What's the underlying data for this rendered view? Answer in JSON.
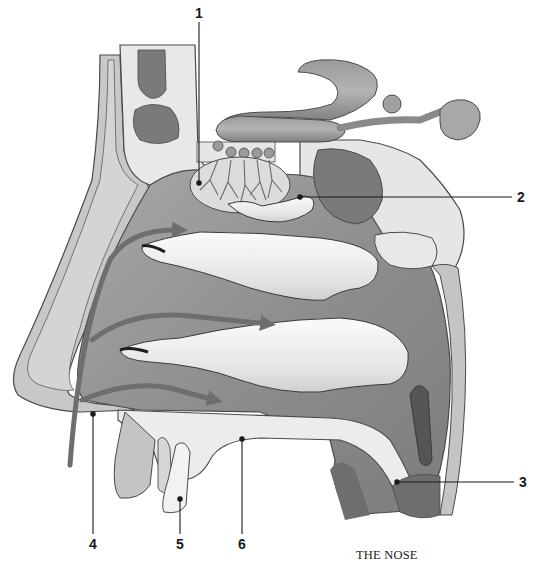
{
  "caption": "THE NOSE",
  "colors": {
    "bone_outline": "#4a4a4a",
    "cartilage_fill": "#c4c4c4",
    "light_fill": "#e6e6e6",
    "cavity_fill": "#9a9a9a",
    "sinus_fill": "#7a7a7a",
    "turbinate_fill": "#f2f2f2",
    "airflow_arrow": "#6e6e6e",
    "leader_line": "#1a1a1a"
  },
  "callouts": [
    {
      "id": "1",
      "label": "1",
      "label_x": 199,
      "label_y": 13,
      "anchor_x": 199,
      "anchor_y": 183
    },
    {
      "id": "2",
      "label": "2",
      "label_x": 521,
      "label_y": 197,
      "anchor_x": 300,
      "anchor_y": 197
    },
    {
      "id": "3",
      "label": "3",
      "label_x": 523,
      "label_y": 482,
      "anchor_x": 397,
      "anchor_y": 482
    },
    {
      "id": "4",
      "label": "4",
      "label_x": 93,
      "label_y": 544,
      "anchor_x": 93,
      "anchor_y": 414
    },
    {
      "id": "5",
      "label": "5",
      "label_x": 180,
      "label_y": 544,
      "anchor_x": 180,
      "anchor_y": 499
    },
    {
      "id": "6",
      "label": "6",
      "label_x": 242,
      "label_y": 544,
      "anchor_x": 242,
      "anchor_y": 439
    }
  ],
  "structures": {
    "olfactory_bulb": "olfactory-bulb",
    "olfactory_nerve_cells": 5,
    "turbinates": [
      "superior-turbinate",
      "middle-turbinate",
      "inferior-turbinate"
    ],
    "airflow_arrows": 3
  }
}
